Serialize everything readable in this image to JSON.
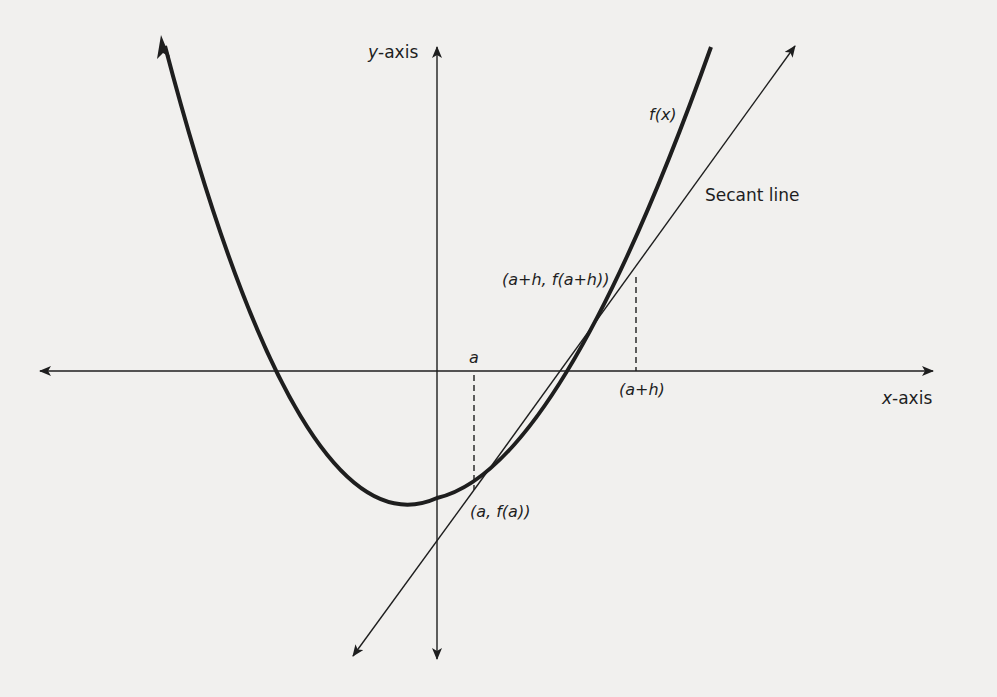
{
  "diagram": {
    "colors": {
      "background": "#f1f0ee",
      "ink": "#1e1e1e"
    },
    "axes": {
      "x_label_var": "x",
      "x_label_suffix": "-axis",
      "y_label_var": "y",
      "y_label_suffix": "-axis"
    },
    "curve_label": "f(x)",
    "secant_label": "Secant line",
    "points": {
      "a_label": "a",
      "a_plus_h_label": "(a+h)",
      "point_a_label": "(a, f(a))",
      "point_a_plus_h_label": "(a+h, f(a+h))"
    }
  }
}
